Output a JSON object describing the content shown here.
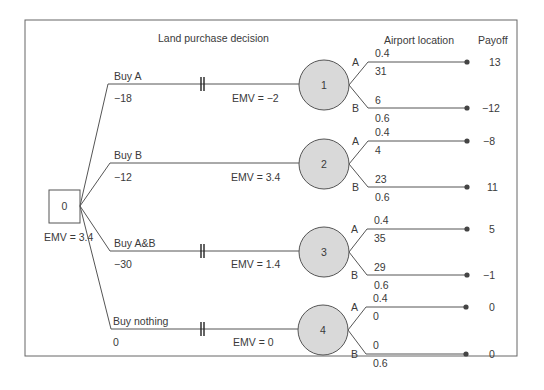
{
  "headers": {
    "decision": "Land purchase decision",
    "chance": "Airport location",
    "payoff": "Payoff"
  },
  "root": {
    "label": "0",
    "emv": "EMV = 3.4"
  },
  "branches": [
    {
      "name": "Buy A",
      "cost": "−18",
      "emv": "EMV = −2",
      "pruned": true,
      "node": "1",
      "outcomes": [
        {
          "label": "A",
          "prob": "0.4",
          "value": "31",
          "payoff": "13"
        },
        {
          "label": "B",
          "prob": "0.6",
          "value": "6",
          "payoff": "−12"
        }
      ]
    },
    {
      "name": "Buy B",
      "cost": "−12",
      "emv": "EMV = 3.4",
      "pruned": false,
      "node": "2",
      "outcomes": [
        {
          "label": "A",
          "prob": "0.4",
          "value": "4",
          "payoff": "−8"
        },
        {
          "label": "B",
          "prob": "0.6",
          "value": "23",
          "payoff": "11"
        }
      ]
    },
    {
      "name": "Buy A&B",
      "cost": "−30",
      "emv": "EMV = 1.4",
      "pruned": true,
      "node": "3",
      "outcomes": [
        {
          "label": "A",
          "prob": "0.4",
          "value": "35",
          "payoff": "5"
        },
        {
          "label": "B",
          "prob": "0.6",
          "value": "29",
          "payoff": "−1"
        }
      ]
    },
    {
      "name": "Buy nothing",
      "cost": "0",
      "emv": "EMV = 0",
      "pruned": true,
      "node": "4",
      "outcomes": [
        {
          "label": "A",
          "prob": "0.4",
          "value": "0",
          "payoff": "0"
        },
        {
          "label": "B",
          "prob": "0.6",
          "value": "0",
          "payoff": "0"
        }
      ]
    }
  ],
  "colors": {
    "chance_fill": "#d9d9d9",
    "line": "#555555",
    "frame": "#666666"
  }
}
